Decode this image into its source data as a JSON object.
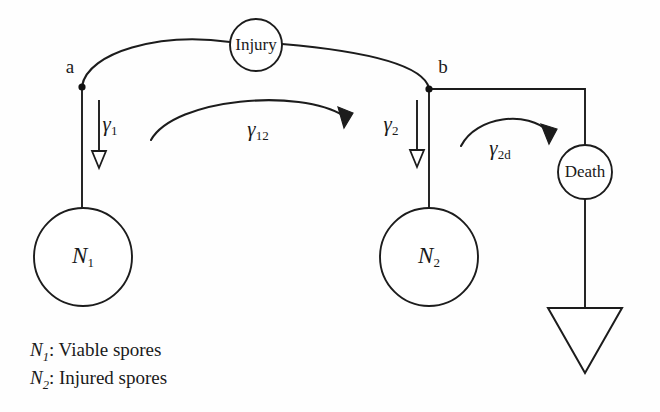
{
  "figure": {
    "background_color": "#fefefe",
    "line_color": "#1c1c1c"
  },
  "nodes": {
    "injury": {
      "label": "Injury",
      "shape": "circle",
      "cx": 256,
      "cy": 45,
      "r": 26
    },
    "death": {
      "label": "Death",
      "shape": "circle",
      "cx": 585,
      "cy": 172,
      "r": 27
    },
    "n1": {
      "label": "N",
      "subscript": "1",
      "shape": "circle",
      "cx": 83,
      "cy": 257,
      "r": 49
    },
    "n2": {
      "label": "N",
      "subscript": "2",
      "shape": "circle",
      "cx": 429,
      "cy": 257,
      "r": 49
    },
    "sink": {
      "label": "",
      "shape": "triangle-down",
      "cx": 585,
      "top_y": 308,
      "apex_y": 372,
      "half_width": 37
    }
  },
  "junctions": {
    "a": {
      "label": "a",
      "x": 82,
      "y": 87,
      "label_x": 70,
      "label_y": 69
    },
    "b": {
      "label": "b",
      "x": 429,
      "y": 89,
      "label_x": 443,
      "label_y": 69
    }
  },
  "rates": {
    "gamma1": {
      "symbol": "γ",
      "subscript": "1",
      "label_x": 110,
      "label_y": 126
    },
    "gamma12": {
      "symbol": "γ",
      "subscript": "12",
      "label_x": 258,
      "label_y": 131
    },
    "gamma2": {
      "symbol": "γ",
      "subscript": "2",
      "label_x": 391,
      "label_y": 126
    },
    "gamma2d": {
      "symbol": "γ",
      "subscript": "2d",
      "label_x": 500,
      "label_y": 150
    }
  },
  "caption": {
    "lines": [
      {
        "var": "N",
        "sub": "1",
        "text": ": Viable spores",
        "x": 30,
        "y": 356
      },
      {
        "var": "N",
        "sub": "2",
        "text": ": Injured spores",
        "x": 30,
        "y": 384
      }
    ]
  },
  "legend_text": {
    "line1_full": "N1: Viable spores",
    "line2_full": "N2: Injured spores"
  }
}
